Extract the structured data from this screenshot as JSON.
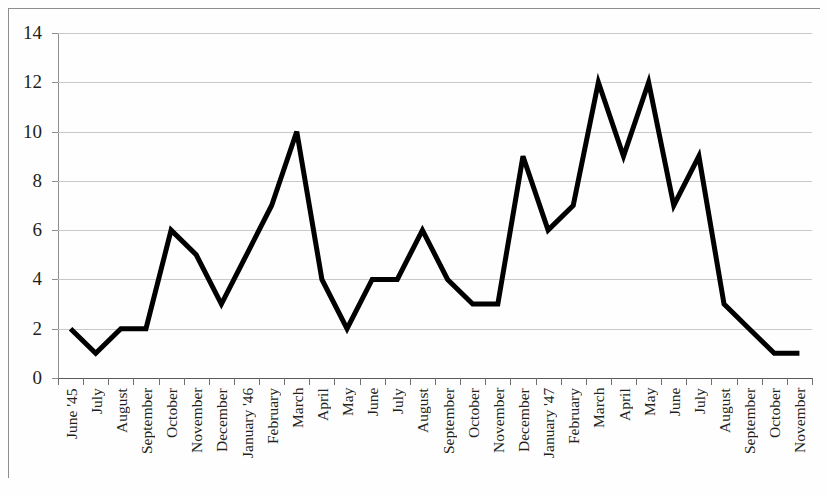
{
  "chart_data": {
    "type": "line",
    "title": "",
    "subtitle": "",
    "xlabel": "",
    "ylabel": "",
    "grid": true,
    "legend": false,
    "legend_position": "none",
    "line_color": "#000000",
    "line_width": 5,
    "ylim": [
      0,
      14
    ],
    "ytick_labels": [
      "14",
      "12",
      "10",
      "8",
      "6",
      "4",
      "2",
      "0"
    ],
    "ytick_values": [
      14,
      12,
      10,
      8,
      6,
      4,
      2,
      0
    ],
    "categories": [
      "June '45",
      "July",
      "August",
      "September",
      "October",
      "November",
      "December",
      "January '46",
      "February",
      "March",
      "April",
      "May",
      "June",
      "July",
      "August",
      "September",
      "October",
      "November",
      "December",
      "January '47",
      "February",
      "March",
      "April",
      "May",
      "June",
      "July",
      "August",
      "September",
      "October",
      "November"
    ],
    "values": [
      2,
      1,
      2,
      2,
      6,
      5,
      3,
      5,
      7,
      10,
      4,
      2,
      4,
      4,
      6,
      4,
      3,
      3,
      9,
      6,
      7,
      12,
      9,
      12,
      7,
      9,
      3,
      2,
      1,
      1
    ],
    "series": [
      {
        "name": "",
        "values": [
          2,
          1,
          2,
          2,
          6,
          5,
          3,
          5,
          7,
          10,
          4,
          2,
          4,
          4,
          6,
          4,
          3,
          3,
          9,
          6,
          7,
          12,
          9,
          12,
          7,
          9,
          3,
          2,
          1,
          1
        ]
      }
    ],
    "points": [
      {
        "x": "June '45",
        "y": 2
      },
      {
        "x": "July",
        "y": 1
      },
      {
        "x": "August",
        "y": 2
      },
      {
        "x": "September",
        "y": 2
      },
      {
        "x": "October",
        "y": 6
      },
      {
        "x": "November",
        "y": 5
      },
      {
        "x": "December",
        "y": 3
      },
      {
        "x": "January '46",
        "y": 5
      },
      {
        "x": "February",
        "y": 7
      },
      {
        "x": "March",
        "y": 10
      },
      {
        "x": "April",
        "y": 4
      },
      {
        "x": "May",
        "y": 2
      },
      {
        "x": "June",
        "y": 4
      },
      {
        "x": "July",
        "y": 4
      },
      {
        "x": "August",
        "y": 6
      },
      {
        "x": "September",
        "y": 4
      },
      {
        "x": "October",
        "y": 3
      },
      {
        "x": "November",
        "y": 3
      },
      {
        "x": "December",
        "y": 9
      },
      {
        "x": "January '47",
        "y": 6
      },
      {
        "x": "February",
        "y": 7
      },
      {
        "x": "March",
        "y": 12
      },
      {
        "x": "April",
        "y": 9
      },
      {
        "x": "May",
        "y": 12
      },
      {
        "x": "June",
        "y": 7
      },
      {
        "x": "July",
        "y": 9
      },
      {
        "x": "August",
        "y": 3
      },
      {
        "x": "September",
        "y": 2
      },
      {
        "x": "October",
        "y": 1
      },
      {
        "x": "November",
        "y": 1
      }
    ]
  }
}
